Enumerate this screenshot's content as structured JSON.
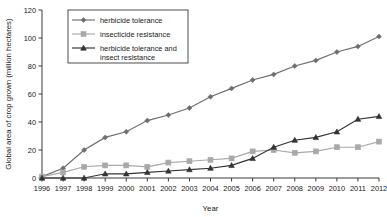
{
  "chart_data": {
    "type": "line",
    "title": "",
    "xlabel": "Year",
    "ylabel": "Global area of crop grown (million hectares)",
    "x": [
      1996,
      1997,
      1998,
      1999,
      2000,
      2001,
      2002,
      2003,
      2004,
      2005,
      2006,
      2007,
      2008,
      2009,
      2010,
      2011,
      2012
    ],
    "categories": [
      "1996",
      "1997",
      "1998",
      "1999",
      "2000",
      "2001",
      "2002",
      "2003",
      "2004",
      "2005",
      "2006",
      "2007",
      "2008",
      "2009",
      "2010",
      "2011",
      "2012"
    ],
    "xlim": [
      1996,
      2012
    ],
    "ylim": [
      0,
      120
    ],
    "yticks": [
      0,
      20,
      40,
      60,
      80,
      100,
      120
    ],
    "ytick_labels": [
      "0",
      "20",
      "40",
      "60",
      "80",
      "100",
      "120"
    ],
    "grid": false,
    "legend_position": "top-left-inside",
    "series": [
      {
        "name": "herbicide tolerance",
        "marker": "diamond",
        "color": "#6e6e6e",
        "values": [
          1,
          7,
          20,
          29,
          33,
          41,
          45,
          50,
          58,
          64,
          70,
          74,
          80,
          84,
          90,
          94,
          101
        ]
      },
      {
        "name": "insecticide resistance",
        "marker": "square",
        "color": "#a8a8a8",
        "values": [
          1,
          4,
          8,
          9,
          9,
          8,
          11,
          12,
          13,
          14,
          19,
          20,
          18,
          19,
          22,
          22,
          26
        ]
      },
      {
        "name": "herbicide tolerance and insect resistance",
        "marker": "triangle",
        "color": "#333333",
        "values": [
          0,
          0,
          0,
          3,
          3,
          4,
          5,
          6,
          7,
          9,
          14,
          22,
          27,
          29,
          33,
          42,
          44
        ]
      }
    ]
  }
}
